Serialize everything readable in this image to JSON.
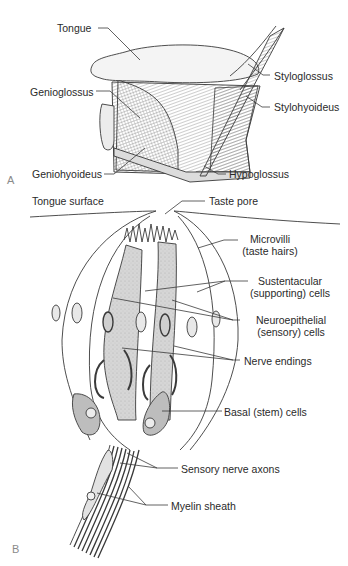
{
  "panel_a": {
    "letter": "A",
    "labels": {
      "tongue": "Tongue",
      "genioglossus": "Genioglossus",
      "geniohyoideus": "Geniohyoideus",
      "styloglossus": "Styloglossus",
      "stylohyoideus": "Stylohyoideus",
      "hypoglossus": "Hypoglossus"
    }
  },
  "panel_b": {
    "letter": "B",
    "labels": {
      "tongue_surface": "Tongue surface",
      "taste_pore": "Taste pore",
      "microvilli_1": "Microvilli",
      "microvilli_2": "(taste hairs)",
      "sustentacular_1": "Sustentacular",
      "sustentacular_2": "(supporting) cells",
      "neuroepithelial_1": "Neuroepithelial",
      "neuroepithelial_2": "(sensory) cells",
      "nerve_endings": "Nerve endings",
      "basal_cells": "Basal (stem) cells",
      "sensory_axons": "Sensory nerve axons",
      "myelin_sheath": "Myelin sheath"
    }
  },
  "colors": {
    "line": "#3a3a3a",
    "cell_fill": "#d4d4d4",
    "basal_fill": "#bdbdbd",
    "text": "#2a2a2a"
  }
}
